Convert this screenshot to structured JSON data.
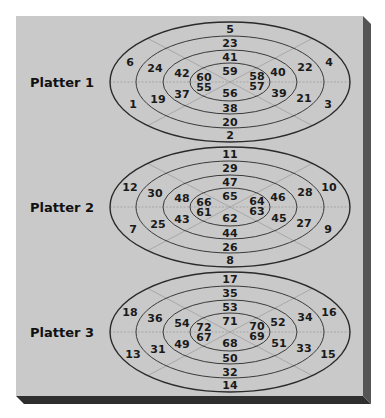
{
  "figure": {
    "colors": {
      "background": "#ffffff",
      "panel_face": "#c9c9c9",
      "panel_edge_right": "#555555",
      "panel_edge_bottom": "#2e2e2e",
      "ring_stroke": "#3a3a3a",
      "text": "#1a1a1a"
    },
    "platters": [
      {
        "label": "Platter 1",
        "rings": {
          "outer": {
            "top": "5",
            "upper_left": "6",
            "upper_right": "4",
            "lower_left": "1",
            "lower_right": "3",
            "bottom": "2"
          },
          "ring3": {
            "top": "23",
            "upper_left": "24",
            "upper_right": "22",
            "lower_left": "19",
            "lower_right": "21",
            "bottom": "20"
          },
          "ring2": {
            "top": "41",
            "upper_left": "42",
            "upper_right": "40",
            "lower_left": "37",
            "lower_right": "39",
            "bottom": "38"
          },
          "inner": {
            "top": "59",
            "upper_left": "60",
            "upper_right": "58",
            "lower_left": "55",
            "lower_right": "57",
            "bottom": "56"
          }
        }
      },
      {
        "label": "Platter 2",
        "rings": {
          "outer": {
            "top": "11",
            "upper_left": "12",
            "upper_right": "10",
            "lower_left": "7",
            "lower_right": "9",
            "bottom": "8"
          },
          "ring3": {
            "top": "29",
            "upper_left": "30",
            "upper_right": "28",
            "lower_left": "25",
            "lower_right": "27",
            "bottom": "26"
          },
          "ring2": {
            "top": "47",
            "upper_left": "48",
            "upper_right": "46",
            "lower_left": "43",
            "lower_right": "45",
            "bottom": "44"
          },
          "inner": {
            "top": "65",
            "upper_left": "66",
            "upper_right": "64",
            "lower_left": "61",
            "lower_right": "63",
            "bottom": "62"
          }
        }
      },
      {
        "label": "Platter 3",
        "rings": {
          "outer": {
            "top": "17",
            "upper_left": "18",
            "upper_right": "16",
            "lower_left": "13",
            "lower_right": "15",
            "bottom": "14"
          },
          "ring3": {
            "top": "35",
            "upper_left": "36",
            "upper_right": "34",
            "lower_left": "31",
            "lower_right": "33",
            "bottom": "32"
          },
          "ring2": {
            "top": "53",
            "upper_left": "54",
            "upper_right": "52",
            "lower_left": "49",
            "lower_right": "51",
            "bottom": "50"
          },
          "inner": {
            "top": "71",
            "upper_left": "72",
            "upper_right": "70",
            "lower_left": "67",
            "lower_right": "69",
            "bottom": "68"
          }
        }
      }
    ]
  }
}
